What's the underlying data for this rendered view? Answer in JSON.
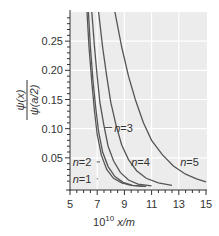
{
  "chart_data": {
    "type": "line",
    "title": "",
    "xlabel": "10^10 x/m",
    "xlabel_base": "10",
    "xlabel_exp": "10",
    "xlabel_var": " x/m",
    "ylabel_num": "ψ(x)",
    "ylabel_den": "ψ(a/2)",
    "xlim": [
      5,
      15
    ],
    "ylim": [
      0,
      0.3
    ],
    "xticks": [
      "5",
      "7",
      "9",
      "11",
      "13",
      "15"
    ],
    "yticks": [
      "0.05",
      "0.10",
      "0.15",
      "0.20",
      "0.25"
    ],
    "grid": true,
    "background": "#ececec",
    "line_color": "#555555",
    "series": [
      {
        "name": "n=1",
        "label": "n=1",
        "x": [
          6.25,
          6.4,
          6.6,
          6.8,
          7.0,
          7.3,
          7.7,
          8.2,
          8.8,
          9.5,
          10.5
        ],
        "y": [
          0.3,
          0.24,
          0.18,
          0.13,
          0.09,
          0.055,
          0.03,
          0.015,
          0.007,
          0.003,
          0.001
        ]
      },
      {
        "name": "n=2",
        "label": "n=2",
        "x": [
          6.35,
          6.5,
          6.7,
          6.9,
          7.1,
          7.4,
          7.8,
          8.3,
          8.9,
          9.6,
          10.6
        ],
        "y": [
          0.3,
          0.24,
          0.18,
          0.135,
          0.095,
          0.06,
          0.035,
          0.018,
          0.008,
          0.003,
          0.001
        ]
      },
      {
        "name": "n=3",
        "label": "n=3",
        "x": [
          6.6,
          6.8,
          7.0,
          7.2,
          7.5,
          7.8,
          8.2,
          8.7,
          9.3,
          10.0,
          11.0
        ],
        "y": [
          0.3,
          0.24,
          0.19,
          0.145,
          0.105,
          0.07,
          0.045,
          0.025,
          0.012,
          0.005,
          0.002
        ]
      },
      {
        "name": "n=4",
        "label": "n=4",
        "x": [
          7.1,
          7.4,
          7.7,
          8.0,
          8.4,
          8.8,
          9.3,
          9.9,
          10.6,
          11.5,
          12.5
        ],
        "y": [
          0.3,
          0.24,
          0.19,
          0.145,
          0.105,
          0.072,
          0.047,
          0.028,
          0.015,
          0.007,
          0.003
        ]
      },
      {
        "name": "n=5",
        "label": "n=5",
        "x": [
          8.3,
          8.8,
          9.3,
          9.8,
          10.4,
          11.0,
          11.8,
          12.6,
          13.5,
          14.3,
          15.0
        ],
        "y": [
          0.3,
          0.24,
          0.19,
          0.15,
          0.11,
          0.08,
          0.055,
          0.036,
          0.022,
          0.014,
          0.009
        ]
      }
    ],
    "annotations": [
      {
        "text": "n=1",
        "x_text": 5.2,
        "y_text": 0.014,
        "x_point": 7.05,
        "y_point": 0.014
      },
      {
        "text": "n=2",
        "x_text": 5.2,
        "y_text": 0.043,
        "x_point": 7.2,
        "y_point": 0.043
      },
      {
        "text": "n=3",
        "x_text": 8.25,
        "y_text": 0.102,
        "x_point": 7.55,
        "y_point": 0.102
      },
      {
        "text": "n=4",
        "x_text": 9.5,
        "y_text": 0.043,
        "x_point": null,
        "y_point": null
      },
      {
        "text": "n=5",
        "x_text": 13.1,
        "y_text": 0.043,
        "x_point": null,
        "y_point": null
      }
    ]
  }
}
